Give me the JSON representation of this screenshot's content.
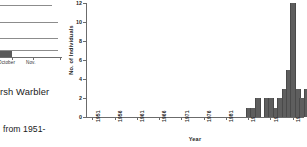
{
  "page": {
    "background": "#ffffff",
    "width": 307,
    "height": 147
  },
  "left_fragment": {
    "name": "partial-figure-and-caption",
    "mini_chart": {
      "bar_label": "bar",
      "x_labels": [
        "October",
        "Nov."
      ],
      "gridline_count": 4,
      "bar_color": "#5a5a5a"
    },
    "caption_text": "rsh Warbler",
    "body_text": "from 1951-"
  },
  "chart_data": {
    "type": "bar",
    "title": "",
    "xlabel": "Year",
    "ylabel": "No. of Individuals",
    "ylim": [
      0,
      12
    ],
    "ytick_values": [
      0,
      2,
      4,
      6,
      8,
      10,
      12
    ],
    "ytick_labels": [
      "0",
      "2",
      "4",
      "6",
      "8",
      "10",
      "12"
    ],
    "xtick_labels": [
      "1951",
      "1956",
      "1961",
      "1966",
      "1971",
      "1976",
      "1981",
      "1986",
      "1991",
      "1996"
    ],
    "xtick_years": [
      1951,
      1956,
      1961,
      1966,
      1971,
      1976,
      1981,
      1986,
      1991,
      1996
    ],
    "xlim": [
      1950,
      1999
    ],
    "grid": false,
    "legend": null,
    "bar_color": "#5e5e5e",
    "categories": [
      1951,
      1952,
      1953,
      1954,
      1955,
      1956,
      1957,
      1958,
      1959,
      1960,
      1961,
      1962,
      1963,
      1964,
      1965,
      1966,
      1967,
      1968,
      1969,
      1970,
      1971,
      1972,
      1973,
      1974,
      1975,
      1976,
      1977,
      1978,
      1979,
      1980,
      1981,
      1982,
      1983,
      1984,
      1985,
      1986,
      1987,
      1988,
      1989,
      1990,
      1991,
      1992,
      1993,
      1994,
      1995,
      1996,
      1997,
      1998
    ],
    "values": [
      0,
      0,
      0,
      0,
      0,
      0,
      0,
      0,
      0,
      0,
      0,
      0,
      0,
      0,
      0,
      0,
      0,
      0,
      0,
      0,
      0,
      0,
      0,
      0,
      0,
      0,
      0,
      0,
      0,
      0,
      0,
      0,
      0,
      0,
      0,
      1,
      1,
      2,
      0,
      2,
      2,
      1,
      2,
      3,
      5,
      12,
      3,
      2
    ],
    "extra_values": [
      3,
      2,
      2,
      5
    ],
    "extra_categories": [
      1999,
      2000,
      2001,
      2002
    ]
  }
}
